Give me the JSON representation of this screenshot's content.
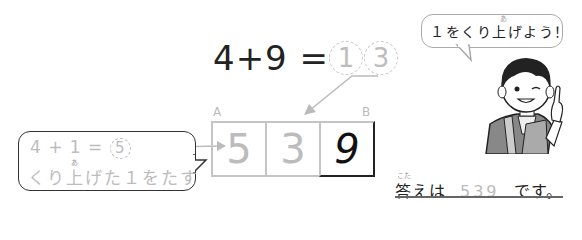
{
  "equation": {
    "left": "4+9 =",
    "digits": [
      "1",
      "3"
    ]
  },
  "boxes": {
    "labels": {
      "a": "A",
      "b": "B"
    },
    "cells": [
      "5",
      "3",
      "9"
    ]
  },
  "left_bubble": {
    "line1_prefix": "4 + 1 =",
    "line1_circle": "5",
    "line2": "くり上げた１をたす",
    "ruby": "あ"
  },
  "right_bubble": {
    "text": "１をくり上げよう！",
    "ruby": "あ"
  },
  "answer": {
    "ruby": "こた",
    "prefix": "答えは",
    "value": "539",
    "suffix": "です。"
  },
  "colors": {
    "hint_gray": "#bcbcbc",
    "text_dark": "#222222",
    "border": "#333333"
  }
}
